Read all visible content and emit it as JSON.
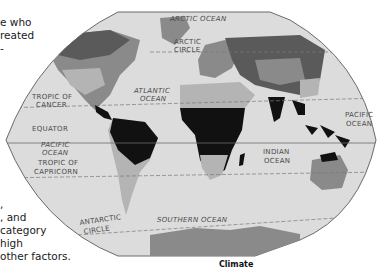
{
  "side_text": {
    "top_lines": [
      "e who",
      "reated",
      "-"
    ],
    "bottom_lines": [
      ",",
      ", and",
      "category",
      "high",
      "other factors."
    ]
  },
  "map": {
    "labels": {
      "arctic_ocean": "ARCTIC OCEAN",
      "arctic_circle_1": "ARCTIC",
      "arctic_circle_2": "CIRCLE",
      "tropic_cancer_1": "TROPIC OF",
      "tropic_cancer_2": "CANCER",
      "atlantic_1": "ATLANTIC",
      "atlantic_2": "OCEAN",
      "equator": "EQUATOR",
      "pacific_w_1": "PACIFIC",
      "pacific_w_2": "OCEAN",
      "tropic_capricorn_1": "TROPIC OF",
      "tropic_capricorn_2": "CAPRICORN",
      "pacific_e_1": "PACIFIC",
      "pacific_e_2": "OCEAN",
      "indian_1": "INDIAN",
      "indian_2": "OCEAN",
      "antarctic_circle_1": "ANTARCTIC",
      "antarctic_circle_2": "CIRCLE",
      "southern_ocean": "SOUTHERN OCEAN"
    },
    "colors": {
      "ocean": "#dcdcdc",
      "outline": "#6b6b6b",
      "land_light": "#b4b4b4",
      "land_mid": "#8a8a8a",
      "land_dark": "#5a5a5a",
      "land_tropical": "#111111"
    }
  },
  "caption": "Climate"
}
